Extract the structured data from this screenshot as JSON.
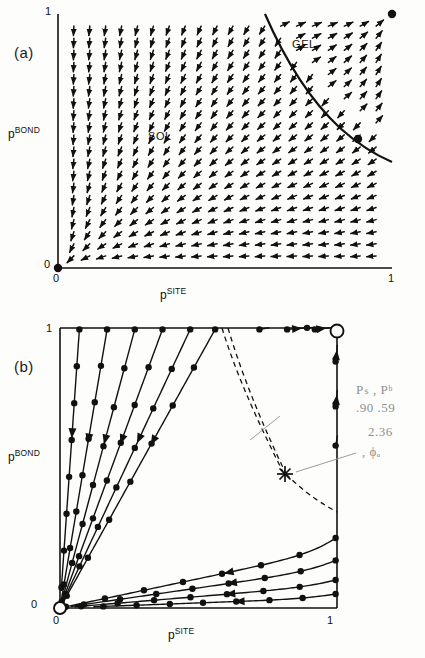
{
  "figure": {
    "background_color": "#fdfdfb",
    "ink_color": "#111111",
    "annotation_color": "#8d8f92"
  },
  "panels": [
    {
      "id": "a",
      "label": "(a)",
      "xlabel_base": "p",
      "xlabel_sup": "SITE",
      "ylabel_base": "p",
      "ylabel_sup": "BOND",
      "x_tick_min": "0",
      "x_tick_max": "1",
      "y_tick_min": "0",
      "y_tick_max": "1",
      "region_labels": [
        {
          "text": "SOL",
          "x": 0.38,
          "y": 0.56
        },
        {
          "text": "GEL",
          "x": 0.8,
          "y": 0.86
        }
      ]
    },
    {
      "id": "b",
      "label": "(b)",
      "xlabel_base": "p",
      "xlabel_sup": "SITE",
      "ylabel_base": "p",
      "ylabel_sup": "BOND",
      "x_tick_min": "0",
      "x_tick_max": "1",
      "y_tick_min": "0",
      "y_tick_max": "1",
      "region_labels": []
    }
  ],
  "handwritten_annotation": {
    "line1": "Pₛ  ,  Pᵇ",
    "line2": ".90  .59",
    "line3": "2.36",
    "line4": ",  ϕₐ"
  },
  "chart_data": {
    "type": "scatter",
    "subplots": [
      {
        "panel": "a",
        "type": "vector-field",
        "xlabel": "p^SITE",
        "ylabel": "p^BOND",
        "xlim": [
          0,
          1
        ],
        "ylim": [
          0,
          1
        ],
        "xticks": [
          0,
          1
        ],
        "yticks": [
          0,
          1
        ],
        "grid": false,
        "annotations": [
          "SOL",
          "GEL"
        ],
        "fixed_points": [
          {
            "name": "sol-sink",
            "x": 0.0,
            "y": 0.0,
            "marker": "filled-circle"
          },
          {
            "name": "gel-sink",
            "x": 1.0,
            "y": 1.0,
            "marker": "filled-circle"
          },
          {
            "name": "critical-saddle",
            "x": 0.9,
            "y": 0.59,
            "marker": "filled-circle"
          }
        ],
        "separatrix": [
          [
            0.62,
            1.0
          ],
          [
            0.66,
            0.93
          ],
          [
            0.7,
            0.86
          ],
          [
            0.74,
            0.8
          ],
          [
            0.78,
            0.74
          ],
          [
            0.82,
            0.69
          ],
          [
            0.86,
            0.64
          ],
          [
            0.9,
            0.59
          ],
          [
            0.94,
            0.55
          ],
          [
            0.97,
            0.52
          ],
          [
            1.0,
            0.5
          ]
        ],
        "vector_field_grid": {
          "nx": 20,
          "ny": 20
        },
        "description": "Arrows flow toward (0,0) in the SOL region and toward (1,1) in the GEL region, separated by the critical separatrix through the saddle point at (0.90, 0.59)."
      },
      {
        "panel": "b",
        "type": "streamlines",
        "xlabel": "p^SITE",
        "ylabel": "p^BOND",
        "xlim": [
          0,
          1
        ],
        "ylim": [
          0,
          1
        ],
        "xticks": [
          0,
          1
        ],
        "yticks": [
          0,
          1
        ],
        "grid": false,
        "fixed_points": [
          {
            "name": "sol-sink",
            "x": 0.0,
            "y": 0.0,
            "marker": "open-circle"
          },
          {
            "name": "gel-sink",
            "x": 1.0,
            "y": 1.0,
            "marker": "open-circle"
          },
          {
            "name": "critical-saddle",
            "x": 0.795,
            "y": 0.565,
            "marker": "star"
          }
        ],
        "separatrix_dashed": [
          [
            0.585,
            1.0
          ],
          [
            0.625,
            0.92
          ],
          [
            0.665,
            0.84
          ],
          [
            0.7,
            0.77
          ],
          [
            0.735,
            0.7
          ],
          [
            0.765,
            0.63
          ],
          [
            0.795,
            0.565
          ],
          [
            0.83,
            0.5
          ],
          [
            0.87,
            0.44
          ],
          [
            0.915,
            0.38
          ],
          [
            0.96,
            0.33
          ],
          [
            1.0,
            0.3
          ]
        ],
        "description": "Trajectories seeded on the top and right boundaries flow toward the (0,0) and (1,1) sinks; dashed curves are the incoming/outgoing separatrices of the saddle fixed point marked with a star."
      }
    ]
  }
}
